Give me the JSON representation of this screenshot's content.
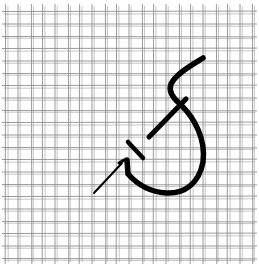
{
  "illustration": {
    "subject": "needlepoint stitch on canvas mesh",
    "grid": {
      "vertical_lines_x": [
        6,
        18,
        31,
        43,
        55,
        68,
        80,
        92,
        105,
        117,
        129,
        142,
        154,
        166,
        179,
        191,
        203,
        216,
        228,
        240,
        252
      ],
      "horizontal_lines_y": [
        12,
        24,
        36,
        49,
        61,
        73,
        86,
        98,
        110,
        123,
        135,
        147,
        160,
        172,
        184,
        197,
        209,
        221,
        234,
        246,
        258
      ],
      "line_color": "#8a8a8a",
      "background": "#ffffff"
    },
    "stitch": {
      "color": "#000000",
      "stroke_width": 5
    },
    "needle": {
      "color": "#000000"
    }
  }
}
